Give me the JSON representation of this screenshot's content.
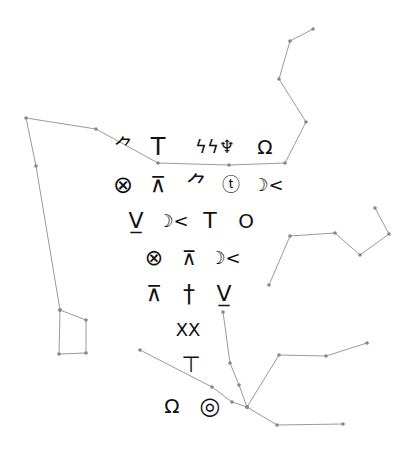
{
  "colors": {
    "background": "#ffffff",
    "ink": "#111111",
    "line": "#9a9a9a",
    "node": "#888888"
  },
  "glyph_rows": [
    {
      "y": 147,
      "glyphs": [
        {
          "name": "runner-figure-glyph",
          "char": "⺈",
          "x": 124,
          "size": 20
        },
        {
          "name": "tee-glyph",
          "char": "T",
          "x": 158,
          "size": 24
        },
        {
          "name": "wave-figure-glyph",
          "char": "ϟϟ♆",
          "x": 215,
          "size": 18
        },
        {
          "name": "keyhole-glyph",
          "char": "Ω",
          "x": 265,
          "size": 20
        }
      ]
    },
    {
      "y": 185,
      "glyphs": [
        {
          "name": "crossed-circle-glyph",
          "char": "⊗",
          "x": 123,
          "size": 24
        },
        {
          "name": "lambda-bar-glyph",
          "char": "⊼",
          "x": 158,
          "size": 22
        },
        {
          "name": "climber-glyph",
          "char": "⺈",
          "x": 197,
          "size": 22
        },
        {
          "name": "circled-t-glyph",
          "char": "ⓣ",
          "x": 231,
          "size": 18
        },
        {
          "name": "moon-x-glyph",
          "char": "☽<",
          "x": 268,
          "size": 18
        }
      ]
    },
    {
      "y": 221,
      "glyphs": [
        {
          "name": "v-underline-glyph",
          "char": "V̲",
          "x": 136,
          "size": 22
        },
        {
          "name": "moon-x-glyph",
          "char": "☽<",
          "x": 173,
          "size": 18
        },
        {
          "name": "tee-glyph",
          "char": "T",
          "x": 210,
          "size": 22
        },
        {
          "name": "circle-glyph",
          "char": "O",
          "x": 246,
          "size": 20
        }
      ]
    },
    {
      "y": 258,
      "glyphs": [
        {
          "name": "crossed-circle-glyph",
          "char": "⊗",
          "x": 154,
          "size": 22
        },
        {
          "name": "lambda-bar-glyph",
          "char": "⊼",
          "x": 189,
          "size": 20
        },
        {
          "name": "moon-x-glyph",
          "char": "☽<",
          "x": 225,
          "size": 18
        }
      ]
    },
    {
      "y": 294,
      "glyphs": [
        {
          "name": "lambda-bar-glyph",
          "char": "⊼",
          "x": 154,
          "size": 22
        },
        {
          "name": "dagger-glyph",
          "char": "†",
          "x": 189,
          "size": 24
        },
        {
          "name": "v-underline-glyph",
          "char": "V̲",
          "x": 224,
          "size": 22
        }
      ]
    },
    {
      "y": 330,
      "glyphs": [
        {
          "name": "double-x-glyph",
          "char": "XX",
          "x": 188,
          "size": 18
        }
      ]
    },
    {
      "y": 365,
      "glyphs": [
        {
          "name": "tee-dagger-glyph",
          "char": "⊤",
          "x": 191,
          "size": 22
        }
      ]
    },
    {
      "y": 406,
      "glyphs": [
        {
          "name": "keyhole-glyph",
          "char": "Ω",
          "x": 172,
          "size": 20
        },
        {
          "name": "moon-circle-glyph",
          "char": "◎",
          "x": 210,
          "size": 24
        }
      ]
    }
  ],
  "constellations": [
    {
      "name": "top-path",
      "points": [
        [
          313,
          29
        ],
        [
          290,
          41
        ],
        [
          279,
          79
        ],
        [
          306,
          122
        ],
        [
          285,
          163
        ],
        [
          229,
          165
        ],
        [
          158,
          163
        ],
        [
          96,
          129
        ],
        [
          26,
          118
        ],
        [
          36,
          166
        ],
        [
          60,
          310
        ],
        [
          86,
          320
        ],
        [
          86,
          353
        ],
        [
          59,
          354
        ],
        [
          60,
          310
        ]
      ]
    },
    {
      "name": "right-path",
      "points": [
        [
          269,
          285
        ],
        [
          290,
          236
        ],
        [
          335,
          233
        ],
        [
          360,
          255
        ],
        [
          389,
          234
        ],
        [
          375,
          208
        ]
      ]
    },
    {
      "name": "bottom-main",
      "points": [
        [
          140,
          350
        ],
        [
          212,
          387
        ],
        [
          232,
          402
        ],
        [
          247,
          407
        ],
        [
          277,
          425
        ],
        [
          343,
          424
        ]
      ]
    },
    {
      "name": "bottom-vertical",
      "points": [
        [
          223,
          312
        ],
        [
          230,
          363
        ],
        [
          239,
          385
        ],
        [
          247,
          407
        ]
      ]
    },
    {
      "name": "bottom-branch",
      "points": [
        [
          247,
          407
        ],
        [
          279,
          355
        ],
        [
          326,
          356
        ],
        [
          367,
          343
        ]
      ]
    }
  ]
}
